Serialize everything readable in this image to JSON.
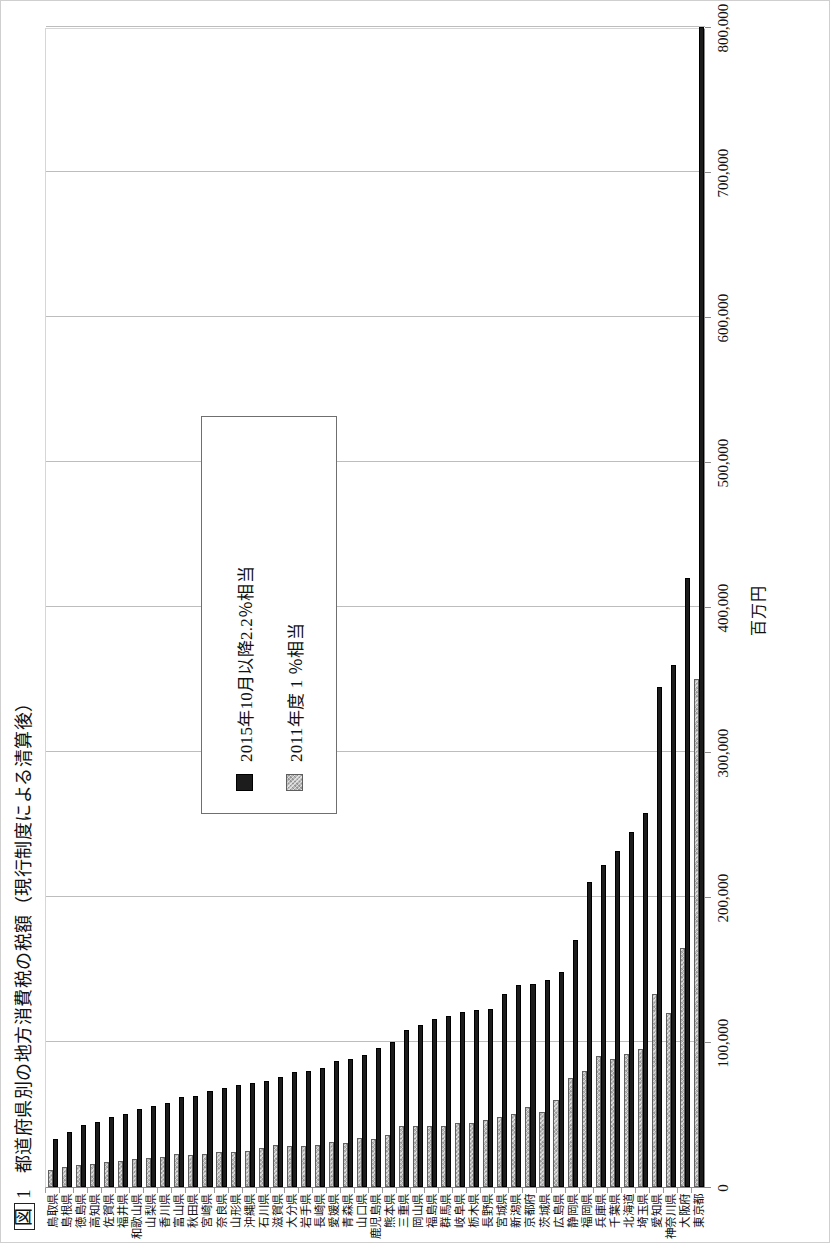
{
  "figure": {
    "number_label": "図",
    "number": "1",
    "title": "都道府県別の地方消費税の税額（現行制度による清算後）"
  },
  "legend": {
    "entries": [
      {
        "key": "s2015",
        "label": "2015年10月以降2.2％相当",
        "color": "#1c1c1c"
      },
      {
        "key": "s2011",
        "label": "2011年度 1 ％相当",
        "color": "#b9b9b9"
      }
    ]
  },
  "axis": {
    "unit_label": "百万円",
    "ticks": [
      "800,000",
      "700,000",
      "600,000",
      "500,000",
      "400,000",
      "300,000",
      "200,000",
      "100,000",
      "0"
    ],
    "tick_values": [
      800000,
      700000,
      600000,
      500000,
      400000,
      300000,
      200000,
      100000,
      0
    ],
    "min": 0,
    "max": 800000
  },
  "chart_data": {
    "type": "bar",
    "orientation": "horizontal",
    "title": "都道府県別の地方消費税の税額（現行制度による清算後）",
    "xlabel": "百万円",
    "ylabel": "",
    "xlim": [
      0,
      800000
    ],
    "grid": true,
    "legend_position": "upper-middle",
    "categories": [
      "東京都",
      "大阪府",
      "神奈川県",
      "愛知県",
      "埼玉県",
      "北海道",
      "千葉県",
      "兵庫県",
      "福岡県",
      "静岡県",
      "広島県",
      "茨城県",
      "京都府",
      "新潟県",
      "宮城県",
      "長野県",
      "栃木県",
      "岐阜県",
      "群馬県",
      "福島県",
      "岡山県",
      "三重県",
      "熊本県",
      "鹿児島県",
      "山口県",
      "青森県",
      "愛媛県",
      "長崎県",
      "岩手県",
      "大分県",
      "滋賀県",
      "石川県",
      "沖縄県",
      "山形県",
      "奈良県",
      "宮崎県",
      "秋田県",
      "富山県",
      "香川県",
      "山梨県",
      "和歌山県",
      "福井県",
      "佐賀県",
      "高知県",
      "徳島県",
      "島根県",
      "鳥取県"
    ],
    "series": [
      {
        "name": "2015年10月以降2.2％相当",
        "color": "#1c1c1c",
        "values": [
          800000,
          420000,
          360000,
          345000,
          258000,
          245000,
          232000,
          222000,
          210000,
          170000,
          148000,
          143000,
          140000,
          139000,
          133000,
          123000,
          122000,
          121000,
          118000,
          116000,
          112000,
          108000,
          100000,
          96000,
          91000,
          88000,
          87000,
          82000,
          80000,
          79000,
          76000,
          73000,
          72000,
          70000,
          68000,
          66000,
          63000,
          62000,
          58000,
          56000,
          54000,
          50000,
          48000,
          45000,
          43000,
          38000,
          33000
        ]
      },
      {
        "name": "2011年度 1 ％相当",
        "color": "#b9b9b9",
        "values": [
          350000,
          165000,
          120000,
          133000,
          95000,
          92000,
          88000,
          90000,
          80000,
          75000,
          60000,
          52000,
          55000,
          50000,
          48000,
          46000,
          44000,
          44000,
          42000,
          42000,
          42000,
          42000,
          36000,
          33000,
          34000,
          30000,
          31000,
          29000,
          28000,
          28000,
          29000,
          27000,
          25000,
          24000,
          24000,
          23000,
          22000,
          23000,
          21000,
          20000,
          19000,
          18000,
          17000,
          16000,
          15000,
          14000,
          12000
        ]
      }
    ]
  }
}
